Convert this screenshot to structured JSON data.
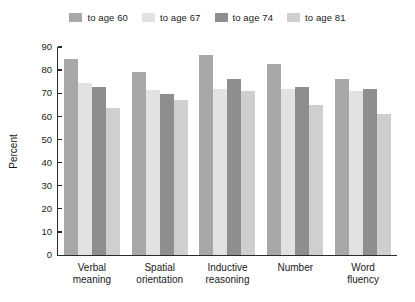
{
  "chart_data": {
    "type": "bar",
    "title": "",
    "xlabel": "",
    "ylabel": "Percent",
    "ylim": [
      0,
      90
    ],
    "yticks": [
      0,
      10,
      20,
      30,
      40,
      50,
      60,
      70,
      80,
      90
    ],
    "grid": false,
    "legend_position": "top",
    "categories": [
      "Verbal\nmeaning",
      "Spatial\norientation",
      "Inductive\nreasoning",
      "Number",
      "Word\nfluency"
    ],
    "category_lines": [
      [
        "Verbal",
        "meaning"
      ],
      [
        "Spatial",
        "orientation"
      ],
      [
        "Inductive",
        "reasoning"
      ],
      [
        "Number",
        ""
      ],
      [
        "Word",
        "fluency"
      ]
    ],
    "series": [
      {
        "name": "to age 60",
        "color": "#a8a8a8",
        "values": [
          85,
          79,
          86.5,
          82.5,
          76
        ]
      },
      {
        "name": "to age 67",
        "color": "#e2e2e2",
        "values": [
          74.5,
          71.5,
          72,
          72,
          71
        ]
      },
      {
        "name": "to age 74",
        "color": "#8e8e8e",
        "values": [
          72.5,
          69.5,
          76,
          72.5,
          72
        ]
      },
      {
        "name": "to age 81",
        "color": "#cfcfcf",
        "values": [
          63.5,
          67,
          71,
          65,
          61
        ]
      }
    ]
  },
  "legend": {
    "items": [
      {
        "label": "to age 60",
        "color": "#a8a8a8"
      },
      {
        "label": "to age 67",
        "color": "#e2e2e2"
      },
      {
        "label": "to age 74",
        "color": "#8e8e8e"
      },
      {
        "label": "to age 81",
        "color": "#cfcfcf"
      }
    ]
  },
  "axis": {
    "y_label": "Percent",
    "y_ticks": [
      "90",
      "80",
      "70",
      "60",
      "50",
      "40",
      "30",
      "20",
      "10",
      "0"
    ]
  }
}
